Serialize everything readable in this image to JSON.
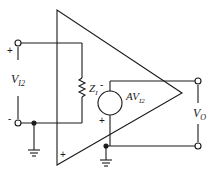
{
  "diagram": {
    "type": "circuit",
    "labels": {
      "input_voltage": "V",
      "input_voltage_sub": "I2",
      "input_impedance": "Z",
      "input_impedance_sub": "I",
      "source_gain": "AV",
      "source_gain_sub": "I2",
      "output_voltage": "V",
      "output_voltage_sub": "O",
      "input_plus": "+",
      "input_minus": "-",
      "source_minus": "-",
      "source_plus": "+",
      "amp_plus": "+"
    },
    "colors": {
      "line": "#1a1a1a",
      "background": "#ffffff"
    }
  }
}
